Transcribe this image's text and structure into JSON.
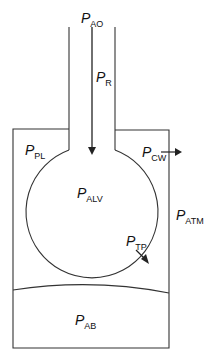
{
  "diagram": {
    "colors": {
      "line": "#333333",
      "background": "#ffffff",
      "text": "#111111"
    },
    "labels": {
      "airway_opening": {
        "main": "P",
        "sub": "AO"
      },
      "resistive": {
        "main": "P",
        "sub": "R"
      },
      "pleural": {
        "main": "P",
        "sub": "PL"
      },
      "chest_wall": {
        "main": "P",
        "sub": "CW"
      },
      "alveolar": {
        "main": "P",
        "sub": "ALV"
      },
      "atmospheric": {
        "main": "P",
        "sub": "ATM"
      },
      "transpulmonary": {
        "main": "P",
        "sub": "TP"
      },
      "abdominal": {
        "main": "P",
        "sub": "AB"
      }
    },
    "components": [
      "airway tube",
      "alveolus (lung)",
      "chest wall box",
      "diaphragm",
      "abdomen"
    ]
  }
}
